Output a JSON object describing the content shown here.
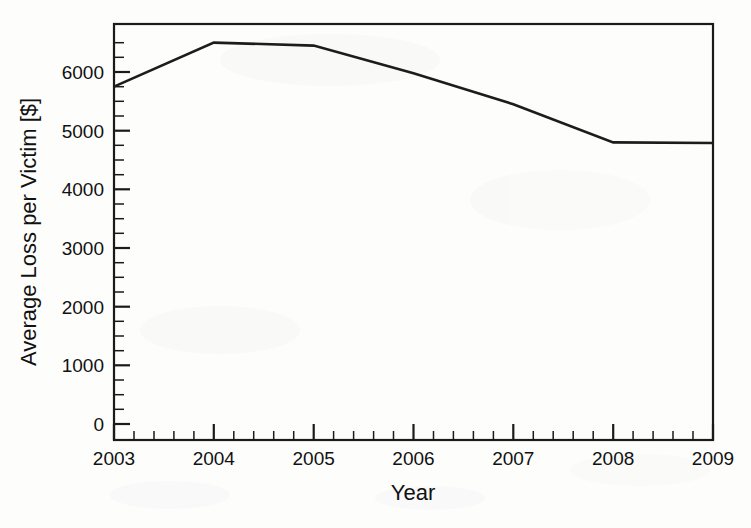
{
  "chart_data": {
    "type": "line",
    "title": "",
    "subtitle": "",
    "xlabel": "Year",
    "ylabel": "Average Loss per Victim [$]",
    "x": [
      2003,
      2004,
      2005,
      2006,
      2007,
      2008,
      2009
    ],
    "categories": [
      "2003",
      "2004",
      "2005",
      "2006",
      "2007",
      "2008",
      "2009"
    ],
    "values": [
      5750,
      6500,
      6450,
      5980,
      5450,
      4800,
      4790
    ],
    "series": [
      {
        "name": "Average Loss per Victim",
        "values": [
          5750,
          6500,
          6450,
          5980,
          5450,
          4800,
          4790
        ]
      }
    ],
    "xlim": [
      2003,
      2009
    ],
    "ylim": [
      0,
      6800
    ],
    "x_ticks": [
      "2003",
      "2004",
      "2005",
      "2006",
      "2007",
      "2008",
      "2009"
    ],
    "y_ticks": [
      "0",
      "1000",
      "2000",
      "3000",
      "4000",
      "5000",
      "6000"
    ],
    "y_tick_values": [
      0,
      1000,
      2000,
      3000,
      4000,
      5000,
      6000
    ],
    "x_minor_ticks_per_interval": 5,
    "y_minor_ticks_per_interval": 4,
    "grid": false,
    "legend": false,
    "legend_position": "none",
    "line_color": "#1c1c1c",
    "background_color": "#fdfdfc",
    "annotations": []
  },
  "axes": {
    "x_title": "Year",
    "y_title": "Average Loss per Victim [$]",
    "x_tick_labels": [
      "2003",
      "2004",
      "2005",
      "2006",
      "2007",
      "2008",
      "2009"
    ],
    "y_tick_labels": [
      "0",
      "1000",
      "2000",
      "3000",
      "4000",
      "5000",
      "6000"
    ]
  }
}
